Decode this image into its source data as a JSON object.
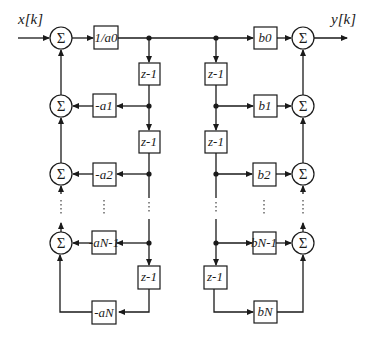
{
  "diagram": {
    "type": "direct-form-II-filter-block-diagram",
    "input_label": "x[k]",
    "output_label": "y[k]",
    "sum_symbol": "Σ",
    "gain_input": "1/a0",
    "delay_label": "z-1",
    "feedback_gains": [
      "-a1",
      "-a2",
      "-aN-1",
      "-aN"
    ],
    "feedforward_gains": [
      "b0",
      "b1",
      "b2",
      "bN-1",
      "bN"
    ],
    "ellipsis": "⋮",
    "colors": {
      "stroke": "#1a1a1a",
      "background": "#ffffff"
    }
  }
}
